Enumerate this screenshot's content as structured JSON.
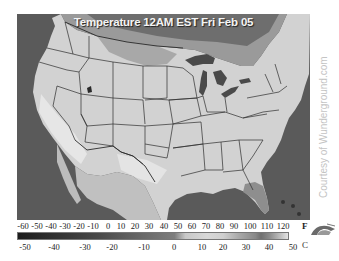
{
  "map": {
    "title": "Temperature 12AM EST Fri Feb 05",
    "credit": "Courtesy of Wunderground.com",
    "region": "Continental United States",
    "colors": {
      "water": "#5a5a5a",
      "land_light": "#d4d4d4",
      "land_mid": "#bdbdbd",
      "cold_band": "#7a7a7a",
      "lakes": "#4a4a4a",
      "borders": "#2a2a2a"
    }
  },
  "legend": {
    "fahrenheit_unit": "F",
    "celsius_unit": "C",
    "fahrenheit_ticks": [
      "-60",
      "-50",
      "-40",
      "-30",
      "-20",
      "-10",
      "0",
      "10",
      "20",
      "30",
      "40",
      "50",
      "60",
      "70",
      "80",
      "90",
      "100",
      "110",
      "120"
    ],
    "celsius_ticks": [
      "-50",
      "-40",
      "-30",
      "-20",
      "-10",
      "0",
      "10",
      "20",
      "30",
      "40",
      "50"
    ],
    "logo_icon": "wunderground-logo-icon"
  }
}
